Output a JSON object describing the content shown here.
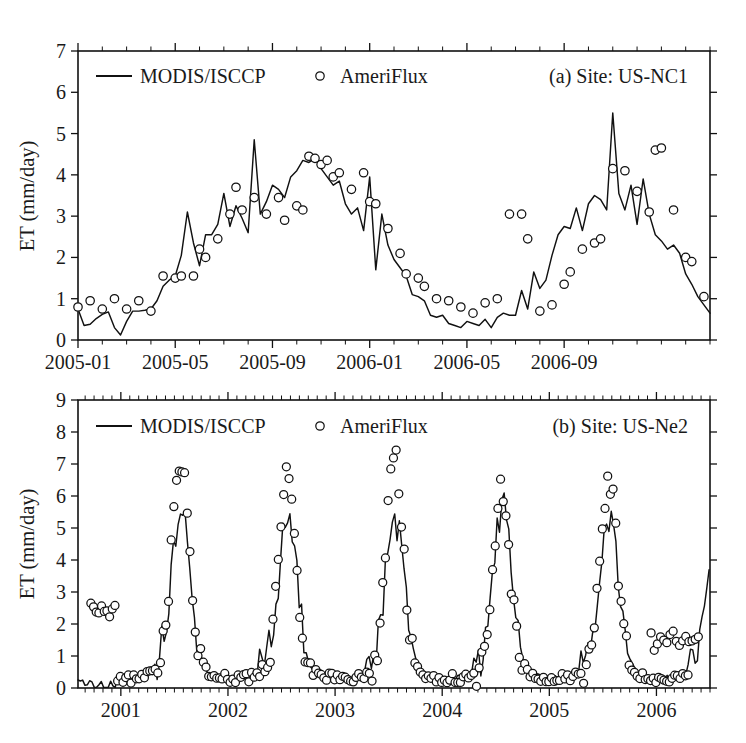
{
  "figure": {
    "panels": [
      {
        "id": "a",
        "label": "(a) Site: US-NC1",
        "legend": {
          "line_label": "MODIS/ISCCP",
          "marker_label": "AmeriFlux"
        }
      },
      {
        "id": "b",
        "label": "(b) Site: US-Ne2",
        "legend": {
          "line_label": "MODIS/ISCCP",
          "marker_label": "AmeriFlux"
        }
      }
    ]
  },
  "chart_data": [
    {
      "type": "line",
      "panel": "a",
      "title": "(a) Site: US-NC1",
      "xlabel": "",
      "ylabel": "ET (mm/day)",
      "ylim": [
        0,
        7
      ],
      "yticks": [
        0,
        1,
        2,
        3,
        4,
        5,
        6,
        7
      ],
      "xlim": [
        0,
        96
      ],
      "xticks": [
        0,
        16,
        32,
        48,
        64,
        80
      ],
      "xticklabels": [
        "2005-01",
        "2005-05",
        "2005-09",
        "2006-01",
        "2006-05",
        "2006-09"
      ],
      "grid": false,
      "legend_position": "top-left",
      "annotations": [
        "(a) Site: US-NC1"
      ],
      "series": [
        {
          "name": "MODIS/ISCCP",
          "style": "line",
          "x": [
            0,
            1,
            2,
            3,
            4,
            5,
            6,
            7,
            8,
            9,
            10,
            11,
            12,
            13,
            14,
            15,
            16,
            17,
            18,
            19,
            20,
            21,
            22,
            23,
            24,
            25,
            26,
            27,
            28,
            29,
            30,
            31,
            32,
            33,
            34,
            35,
            36,
            37,
            38,
            39,
            40,
            41,
            42,
            43,
            44,
            45,
            46,
            47,
            48,
            49,
            50,
            51,
            52,
            53,
            54,
            55,
            56,
            57,
            58,
            59,
            60,
            61,
            62,
            63,
            64,
            65,
            66,
            67,
            68,
            69,
            70,
            71,
            72,
            73,
            74,
            75,
            76,
            77,
            78,
            79,
            80,
            81,
            82,
            83,
            84,
            85,
            86,
            87,
            88,
            89,
            90,
            91,
            92,
            93,
            94,
            95
          ],
          "values": [
            0.75,
            0.35,
            0.38,
            0.52,
            0.62,
            0.68,
            0.3,
            0.12,
            0.45,
            0.7,
            0.7,
            0.72,
            0.75,
            0.95,
            1.3,
            1.45,
            1.55,
            2.05,
            3.1,
            2.35,
            1.8,
            2.55,
            2.55,
            2.8,
            3.55,
            2.75,
            3.25,
            2.95,
            2.6,
            4.85,
            3.05,
            3.35,
            3.75,
            3.65,
            3.45,
            3.95,
            4.1,
            4.35,
            4.3,
            4.4,
            4.15,
            3.95,
            3.75,
            3.85,
            3.3,
            3.05,
            3.2,
            2.65,
            3.95,
            1.7,
            3.05,
            2.3,
            1.95,
            1.75,
            1.55,
            1.1,
            1.05,
            0.95,
            0.6,
            0.55,
            0.6,
            0.4,
            0.35,
            0.3,
            0.45,
            0.4,
            0.35,
            0.5,
            0.3,
            0.55,
            0.65,
            0.6,
            0.6,
            1.2,
            0.75,
            1.65,
            1.25,
            1.45,
            2.05,
            2.55,
            2.75,
            2.7,
            3.2,
            2.65,
            3.3,
            3.5,
            3.4,
            3.15,
            5.5,
            3.55,
            3.15,
            3.75,
            2.8,
            3.9,
            3.05,
            2.55
          ],
          "tail": {
            "x": [
              96,
              97,
              98,
              99,
              100,
              101,
              102,
              103,
              104
            ],
            "values": [
              2.4,
              2.2,
              2.3,
              2.1,
              1.6,
              1.35,
              1.05,
              0.85,
              0.65
            ]
          }
        },
        {
          "name": "AmeriFlux",
          "style": "markers",
          "x": [
            0,
            2,
            4,
            6,
            8,
            10,
            12,
            14,
            16,
            17,
            19,
            20,
            21,
            23,
            25,
            26,
            27,
            29,
            31,
            33,
            34,
            36,
            37,
            38,
            39,
            40,
            41,
            42,
            43,
            45,
            47,
            48,
            49,
            51,
            53,
            54,
            56,
            57,
            59,
            61,
            63,
            65,
            67,
            69,
            71,
            73,
            74,
            76,
            78,
            80,
            81,
            83,
            85,
            86,
            88,
            90,
            92,
            94
          ],
          "values": [
            0.8,
            0.95,
            0.75,
            1.0,
            0.75,
            0.95,
            0.7,
            1.55,
            1.5,
            1.55,
            1.55,
            2.2,
            2.0,
            2.45,
            3.05,
            3.7,
            3.15,
            3.45,
            3.05,
            3.45,
            2.9,
            3.25,
            3.15,
            4.45,
            4.4,
            4.25,
            4.35,
            3.95,
            4.05,
            3.65,
            4.05,
            3.35,
            3.3,
            2.7,
            2.1,
            1.6,
            1.5,
            1.3,
            1.0,
            0.95,
            0.8,
            0.65,
            0.9,
            1.0,
            3.05,
            3.05,
            2.45,
            0.7,
            0.85,
            1.35,
            1.65,
            2.2,
            2.35,
            2.45,
            4.15,
            4.1,
            3.6,
            3.1
          ],
          "tail": {
            "x": [
              95,
              96,
              98,
              100,
              101,
              103
            ],
            "values": [
              4.6,
              4.65,
              3.15,
              2.0,
              1.9,
              1.05
            ]
          }
        }
      ]
    },
    {
      "type": "line",
      "panel": "b",
      "title": "(b) Site: US-Ne2",
      "xlabel": "",
      "ylabel": "ET (mm/day)",
      "ylim": [
        0,
        9
      ],
      "yticks": [
        0,
        1,
        2,
        3,
        4,
        5,
        6,
        7,
        8,
        9
      ],
      "xlim": [
        2000.6,
        2006.5
      ],
      "xticks": [
        2001,
        2002,
        2003,
        2004,
        2005,
        2006
      ],
      "xticklabels": [
        "2001",
        "2002",
        "2003",
        "2004",
        "2005",
        "2006"
      ],
      "grid": false,
      "legend_position": "top-left",
      "annotations": [
        "(b) Site: US-Ne2"
      ],
      "seasonal_peaks": {
        "modis_line": [
          4.75,
          4.6,
          4.55,
          4.9,
          4.65,
          4.55
        ],
        "ameriflux_obs": [
          6.4,
          5.9,
          6.3,
          5.45,
          5.85,
          1.75
        ],
        "winter_baseline": 0.3
      },
      "series": [
        {
          "name": "MODIS/ISCCP",
          "style": "line",
          "note": "6 annual cycles, 2001-2006, daily/8-day resolution"
        },
        {
          "name": "AmeriFlux",
          "style": "markers",
          "note": "tower observations, sparse after mid-2006"
        }
      ]
    }
  ]
}
